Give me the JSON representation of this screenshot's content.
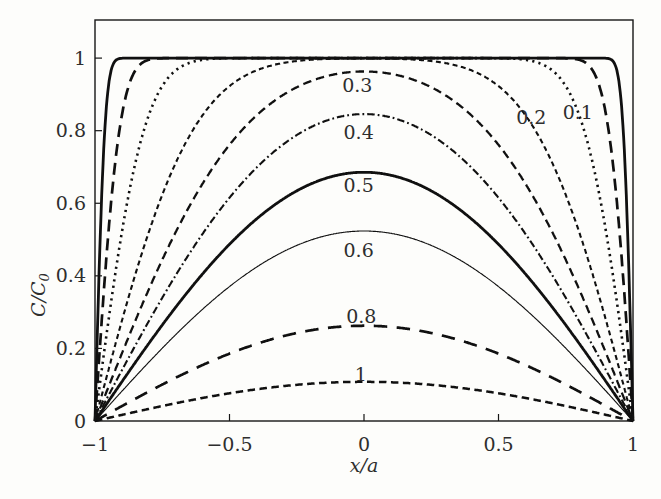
{
  "chart_data": {
    "type": "line",
    "title": "",
    "xlabel": "x/a",
    "ylabel": "C/C₀",
    "xlim": [
      -1,
      1
    ],
    "ylim": [
      0,
      1.105
    ],
    "grid": false,
    "legend": "none",
    "x_ticks": [
      {
        "v": -1,
        "label": "−1"
      },
      {
        "v": -0.5,
        "label": "−0.5"
      },
      {
        "v": 0,
        "label": "0"
      },
      {
        "v": 0.5,
        "label": "0.5"
      },
      {
        "v": 1,
        "label": "1"
      }
    ],
    "y_ticks": [
      {
        "v": 0,
        "label": "0"
      },
      {
        "v": 0.2,
        "label": "0.2"
      },
      {
        "v": 0.4,
        "label": "0.4"
      },
      {
        "v": 0.6,
        "label": "0.6"
      },
      {
        "v": 0.8,
        "label": "0.8"
      },
      {
        "v": 1,
        "label": "1"
      }
    ],
    "model": {
      "curve_parameter": "sqrt(Dt/a^2)",
      "profile": "C/C0 = (4/pi) * sum_n ((-1)^n/(2n+1)) * exp(-(2n+1)^2 pi^2 s^2 / 4) * cos((2n+1) pi x / 2)",
      "endpoints": "all curves pass through (−1,0) and (1,0)"
    },
    "series": [
      {
        "label": "",
        "s": 0.02,
        "center_value": 1.0,
        "line": {
          "width": 2.8,
          "dash": ""
        }
      },
      {
        "label": "",
        "s": 0.05,
        "center_value": 1.0,
        "line": {
          "width": 2.7,
          "dash": "12 7"
        }
      },
      {
        "label": "0.1",
        "s": 0.1,
        "center_value": 1.0,
        "line": {
          "width": 2.6,
          "dash": "2.2 4.2"
        }
      },
      {
        "label": "0.2",
        "s": 0.2,
        "center_value": 1.0,
        "line": {
          "width": 2.1,
          "dash": "5 3.5"
        }
      },
      {
        "label": "0.3",
        "s": 0.3,
        "center_value": 0.96,
        "line": {
          "width": 2.3,
          "dash": "8.5 5"
        }
      },
      {
        "label": "0.4",
        "s": 0.4,
        "center_value": 0.85,
        "line": {
          "width": 2.1,
          "dash": "7.5 3 1.8 3"
        }
      },
      {
        "label": "0.5",
        "s": 0.5,
        "center_value": 0.69,
        "line": {
          "width": 2.8,
          "dash": ""
        }
      },
      {
        "label": "0.6",
        "s": 0.6,
        "center_value": 0.52,
        "line": {
          "width": 1.15,
          "dash": ""
        }
      },
      {
        "label": "0.8",
        "s": 0.8,
        "center_value": 0.26,
        "line": {
          "width": 2.7,
          "dash": "13.5 9.5"
        }
      },
      {
        "label": "1",
        "s": 1.0,
        "center_value": 0.11,
        "line": {
          "width": 2.5,
          "dash": "7.5 4.5"
        }
      }
    ],
    "curve_labels": [
      {
        "text": "0.3",
        "x": -0.025,
        "y": 0.925
      },
      {
        "text": "0.4",
        "x": -0.02,
        "y": 0.795
      },
      {
        "text": "0.5",
        "x": -0.02,
        "y": 0.648
      },
      {
        "text": "0.6",
        "x": -0.02,
        "y": 0.47
      },
      {
        "text": "0.8",
        "x": -0.01,
        "y": 0.289
      },
      {
        "text": "1",
        "x": -0.012,
        "y": 0.127
      },
      {
        "text": "0.2",
        "x": 0.622,
        "y": 0.835
      },
      {
        "text": "0.1",
        "x": 0.795,
        "y": 0.849
      }
    ],
    "layout": {
      "width": 661,
      "height": 499,
      "plot": {
        "left": 95,
        "top": 20,
        "right": 633,
        "bottom": 421
      },
      "tick_len": 7,
      "ylabel_center_y": 295,
      "colors": {
        "ink": "#101010",
        "text": "#2e2e2e",
        "frame": "#161616",
        "background": "#fdfdfb"
      }
    }
  }
}
